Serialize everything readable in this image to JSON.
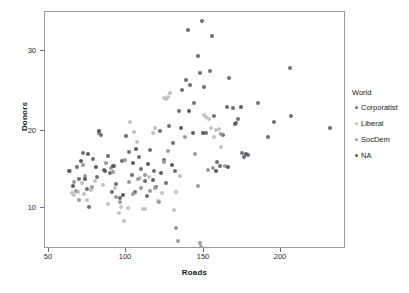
{
  "chart_data": {
    "type": "scatter",
    "title": "",
    "xlabel": "Roads",
    "ylabel": "Donors",
    "xlim": [
      42,
      237
    ],
    "ylim": [
      5.2,
      34.5
    ],
    "xticks": [
      50,
      100,
      150,
      200
    ],
    "yticks": [
      10,
      20,
      30
    ],
    "grid": false,
    "legend": {
      "position": "right",
      "title": "World",
      "entries": [
        {
          "label": "Corporatist",
          "color": "#6f6f74"
        },
        {
          "label": "Liberal",
          "color": "#c2c2c6"
        },
        {
          "label": "SocDem",
          "color": "#9a9aa0"
        },
        {
          "label": "NA",
          "color": "#5a5a60"
        }
      ]
    },
    "series": [
      {
        "name": "Corporatist",
        "color": "#6f6f74",
        "points": [
          [
            62.8,
            15.3
          ],
          [
            64.1,
            13.9
          ],
          [
            66.5,
            17.1
          ],
          [
            68.9,
            12.6
          ],
          [
            70.4,
            10.4
          ],
          [
            73.2,
            16.3
          ],
          [
            75.6,
            14.1
          ],
          [
            77.0,
            19.6
          ],
          [
            78.4,
            19.3
          ],
          [
            80.1,
            15.0
          ],
          [
            82.5,
            16.7
          ],
          [
            84.0,
            14.6
          ],
          [
            85.3,
            12.2
          ],
          [
            86.9,
            15.5
          ],
          [
            88.2,
            13.2
          ],
          [
            90.6,
            11.5
          ],
          [
            92.0,
            16.1
          ],
          [
            94.4,
            19.2
          ],
          [
            96.7,
            17.2
          ],
          [
            98.1,
            14.4
          ],
          [
            100.5,
            12.3
          ],
          [
            102.9,
            16.6
          ],
          [
            104.2,
            15.1
          ],
          [
            106.6,
            13.6
          ],
          [
            108.0,
            11.8
          ],
          [
            110.3,
            17.5
          ],
          [
            112.7,
            14.8
          ],
          [
            114.1,
            12.9
          ],
          [
            116.4,
            19.8
          ],
          [
            118.8,
            16.2
          ],
          [
            120.2,
            13.4
          ],
          [
            122.5,
            20.4
          ],
          [
            124.9,
            18.3
          ],
          [
            126.3,
            14.9
          ],
          [
            128.6,
            22.3
          ],
          [
            131.0,
            24.8
          ],
          [
            133.4,
            26.1
          ],
          [
            134.7,
            32.3
          ],
          [
            136.1,
            25.5
          ],
          [
            138.4,
            23.2
          ],
          [
            140.8,
            29.0
          ],
          [
            142.1,
            27.0
          ],
          [
            143.5,
            33.4
          ],
          [
            144.9,
            25.2
          ],
          [
            146.2,
            19.5
          ],
          [
            148.6,
            27.2
          ],
          [
            150.0,
            31.5
          ],
          [
            151.3,
            21.7
          ],
          [
            153.7,
            16.0
          ],
          [
            155.1,
            15.4
          ],
          [
            157.4,
            19.3
          ],
          [
            159.8,
            22.8
          ],
          [
            161.1,
            26.3
          ],
          [
            163.5,
            22.6
          ],
          [
            165.9,
            20.8
          ],
          [
            167.2,
            21.3
          ],
          [
            169.6,
            17.1
          ],
          [
            171.0,
            16.6
          ],
          [
            173.3,
            16.8
          ],
          [
            180.2,
            23.3
          ],
          [
            186.5,
            19.1
          ],
          [
            190.3,
            20.9
          ],
          [
            200.8,
            27.6
          ],
          [
            201.5,
            21.6
          ],
          [
            226.4,
            20.1
          ]
        ]
      },
      {
        "name": "Liberal",
        "color": "#c2c2c6",
        "points": [
          [
            59.6,
            12.1
          ],
          [
            61.0,
            11.9
          ],
          [
            63.4,
            12.3
          ],
          [
            65.8,
            13.3
          ],
          [
            67.1,
            12.0
          ],
          [
            69.5,
            11.2
          ],
          [
            71.9,
            12.5
          ],
          [
            74.2,
            13.6
          ],
          [
            79.6,
            13.1
          ],
          [
            83.0,
            10.8
          ],
          [
            87.3,
            12.7
          ],
          [
            89.7,
            9.6
          ],
          [
            91.1,
            10.4
          ],
          [
            93.4,
            8.7
          ],
          [
            95.8,
            10.3
          ],
          [
            97.2,
            20.9
          ],
          [
            99.5,
            19.7
          ],
          [
            101.9,
            18.4
          ],
          [
            103.3,
            14.0
          ],
          [
            105.6,
            10.2
          ],
          [
            107.0,
            10.1
          ],
          [
            109.4,
            14.1
          ],
          [
            111.7,
            19.5
          ],
          [
            113.1,
            20.2
          ],
          [
            115.5,
            11.1
          ],
          [
            117.8,
            12.1
          ],
          [
            119.2,
            23.9
          ],
          [
            120.6,
            23.8
          ],
          [
            121.9,
            24.0
          ],
          [
            123.3,
            24.5
          ],
          [
            125.7,
            10.0
          ],
          [
            127.0,
            12.2
          ],
          [
            129.4,
            14.2
          ],
          [
            146.6,
            21.5
          ],
          [
            148.0,
            21.3
          ],
          [
            149.4,
            20.1
          ],
          [
            151.8,
            19.0
          ],
          [
            153.1,
            19.9
          ],
          [
            154.5,
            20.0
          ],
          [
            155.9,
            17.8
          ],
          [
            145.2,
            21.8
          ]
        ]
      },
      {
        "name": "SocDem",
        "color": "#9a9aa0",
        "points": [
          [
            58.2,
            14.9
          ],
          [
            60.6,
            13.5
          ],
          [
            62.0,
            12.4
          ],
          [
            64.3,
            11.3
          ],
          [
            66.7,
            15.6
          ],
          [
            68.1,
            14.2
          ],
          [
            72.5,
            12.9
          ],
          [
            76.8,
            19.7
          ],
          [
            81.2,
            15.8
          ],
          [
            84.6,
            15.2
          ],
          [
            86.0,
            14.7
          ],
          [
            88.3,
            11.6
          ],
          [
            90.7,
            11.0
          ],
          [
            94.1,
            16.2
          ],
          [
            96.4,
            13.5
          ],
          [
            98.8,
            12.0
          ],
          [
            102.2,
            13.9
          ],
          [
            104.5,
            12.8
          ],
          [
            106.9,
            14.3
          ],
          [
            110.0,
            12.4
          ],
          [
            113.4,
            12.7
          ],
          [
            115.8,
            11.0
          ],
          [
            119.1,
            15.9
          ],
          [
            121.5,
            17.3
          ],
          [
            126.9,
            7.8
          ],
          [
            128.3,
            6.2
          ],
          [
            132.6,
            19.0
          ],
          [
            139.0,
            17.0
          ],
          [
            141.4,
            13.0
          ],
          [
            142.7,
            5.9
          ],
          [
            143.1,
            5.4
          ],
          [
            147.5,
            15.0
          ],
          [
            150.9,
            15.2
          ],
          [
            156.2,
            19.4
          ],
          [
            158.6,
            15.4
          ]
        ]
      },
      {
        "name": "NA",
        "color": "#5a5a60",
        "points": [
          [
            57.5,
            14.8
          ],
          [
            59.9,
            13.0
          ],
          [
            65.2,
            16.1
          ],
          [
            67.6,
            13.8
          ],
          [
            70.0,
            16.9
          ],
          [
            74.9,
            15.3
          ],
          [
            77.3,
            19.8
          ],
          [
            80.7,
            14.9
          ],
          [
            85.9,
            15.4
          ],
          [
            92.8,
            11.9
          ],
          [
            99.1,
            15.8
          ],
          [
            100.8,
            17.6
          ],
          [
            108.7,
            15.7
          ],
          [
            112.0,
            13.7
          ],
          [
            117.1,
            14.6
          ],
          [
            124.3,
            15.6
          ],
          [
            130.2,
            20.1
          ],
          [
            135.5,
            22.2
          ],
          [
            137.8,
            19.6
          ],
          [
            144.2,
            19.6
          ],
          [
            152.5,
            14.9
          ],
          [
            160.5,
            15.3
          ],
          [
            164.8,
            20.7
          ],
          [
            168.9,
            22.7
          ],
          [
            172.4,
            16.9
          ]
        ]
      }
    ]
  },
  "axes": {
    "y_label": "Donors",
    "x_label": "Roads",
    "y_tick_labels": [
      "30",
      "20",
      "10"
    ],
    "x_tick_labels": [
      "50",
      "100",
      "150",
      "200"
    ]
  }
}
